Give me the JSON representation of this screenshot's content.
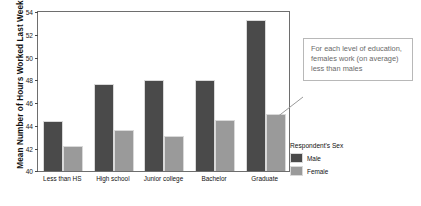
{
  "chart_data": {
    "type": "bar",
    "title": "",
    "subtitle": "",
    "xlabel": "",
    "ylabel": "Mean Number of Hours Worked Last Week",
    "ylim": [
      40,
      54
    ],
    "yticks": [
      40,
      42,
      44,
      46,
      48,
      50,
      52,
      54
    ],
    "ytick_labels": [
      "40",
      "42",
      "44",
      "46",
      "48",
      "50",
      "52",
      "54"
    ],
    "grid": false,
    "legend_position": "right",
    "legend_title": "Respondent's Sex",
    "categories": [
      "Less than HS",
      "High school",
      "Junior college",
      "Bachelor",
      "Graduate"
    ],
    "series": [
      {
        "name": "Male",
        "color": "#4a4a4a",
        "values": [
          44.4,
          47.7,
          48.0,
          48.0,
          53.3
        ]
      },
      {
        "name": "Female",
        "color": "#9a9a9a",
        "values": [
          42.2,
          43.6,
          43.1,
          44.5,
          45.0
        ]
      }
    ],
    "annotations": [
      {
        "text": "For each level of education, females work (on average) less than males",
        "points_to": "Graduate / Female bar"
      }
    ]
  },
  "axis": {
    "y_title": "Mean Number of Hours Worked Last Week",
    "tick_40": "40",
    "tick_42": "42",
    "tick_44": "44",
    "tick_46": "46",
    "tick_48": "48",
    "tick_50": "50",
    "tick_52": "52",
    "tick_54": "54"
  },
  "categories": {
    "c0": "Less than HS",
    "c1": "High school",
    "c2": "Junior college",
    "c3": "Bachelor",
    "c4": "Graduate"
  },
  "legend": {
    "title": "Respondent's Sex",
    "male_label": "Male",
    "female_label": "Female",
    "male_color": "#4a4a4a",
    "female_color": "#9a9a9a"
  },
  "callout": {
    "text": "For each level of education, females work (on average) less than males"
  }
}
